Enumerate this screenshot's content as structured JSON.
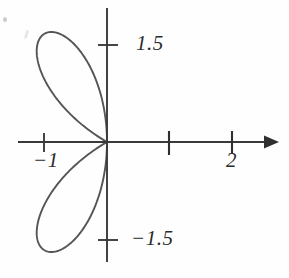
{
  "figure": {
    "title": "",
    "background_color": "#fefefe",
    "origin": {
      "x": 107,
      "y": 142
    },
    "pixels_per_unit": 62.5
  },
  "axes": {
    "x_axis": {
      "name": "x-axis",
      "start_px": 18,
      "end_px": 266,
      "arrow": true,
      "color": "#3a3a3a"
    },
    "y_axis": {
      "name": "y-axis",
      "start_px": 8,
      "end_px": 262,
      "arrow": false,
      "color": "#3a3a3a"
    },
    "ticks": [
      {
        "axis": "y",
        "value": 1.5,
        "label": "1.5",
        "px": 45
      },
      {
        "axis": "y",
        "value": -1.5,
        "label": "−1.5",
        "px": 240
      },
      {
        "axis": "x",
        "value": -1,
        "label": "−1",
        "px": 44
      },
      {
        "axis": "x",
        "value": 1,
        "label": "",
        "px": 169
      },
      {
        "axis": "x",
        "value": 2,
        "label": "2",
        "px": 232
      }
    ]
  },
  "labels": {
    "y_positive": "1.5",
    "y_negative": "−1.5",
    "x_negative": "−1",
    "x_two": "2"
  },
  "colors": {
    "curve_stroke": "#555555",
    "shaded_fill": "#d9d9d9",
    "axis": "#3a3a3a",
    "text": "#2b2b2b",
    "background": "#fefefe"
  },
  "chart_data": {
    "type": "line",
    "subtype": "polar-rose",
    "title": "",
    "xlabel": "",
    "ylabel": "",
    "equation": "r = 2 cos(3θ)",
    "petal_count": 3,
    "max_radius": 2,
    "xlim": [
      -2,
      2
    ],
    "ylim": [
      -2,
      2
    ],
    "grid": false,
    "legend": null,
    "petals": [
      {
        "name": "right-petal",
        "center_angle_deg": 0,
        "tip": {
          "r": 2,
          "theta_deg": 0,
          "x": 2,
          "y": 0
        },
        "shaded": true,
        "fill": "#d9d9d9"
      },
      {
        "name": "upper-left-petal",
        "center_angle_deg": 120,
        "tip": {
          "r": 2,
          "theta_deg": 120,
          "x": -1.0,
          "y": 1.732
        },
        "shaded": false,
        "fill": "none"
      },
      {
        "name": "lower-left-petal",
        "center_angle_deg": 240,
        "tip": {
          "r": 2,
          "theta_deg": 240,
          "x": -1.0,
          "y": -1.732
        },
        "shaded": false,
        "fill": "none"
      }
    ],
    "axis_ticks_x": [
      -1,
      1,
      2
    ],
    "axis_ticks_y": [
      -1.5,
      1.5
    ],
    "tick_labels_x": [
      "−1",
      "",
      "2"
    ],
    "tick_labels_y": [
      "−1.5",
      "1.5"
    ]
  }
}
